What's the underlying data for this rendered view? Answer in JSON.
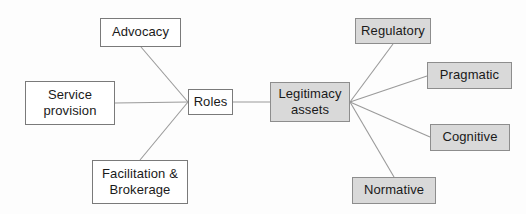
{
  "diagram": {
    "type": "node-link-flow-diagram",
    "canvas": {
      "width": 526,
      "height": 214,
      "background": "#fdfdfd"
    },
    "colors": {
      "plain_fill": "#ffffff",
      "plain_border": "#7a7a7a",
      "filled_fill": "#d9d9d9",
      "filled_border": "#8d8d8d",
      "edge": "#9a9a9a",
      "text": "#1a1a1a"
    },
    "nodes": [
      {
        "id": "advocacy",
        "label": "Advocacy",
        "style": "plain",
        "x": 100,
        "y": 18,
        "w": 81,
        "h": 29
      },
      {
        "id": "service_provision",
        "label": "Service\nprovision",
        "style": "plain",
        "x": 25,
        "y": 81,
        "w": 90,
        "h": 44
      },
      {
        "id": "facilitation_brokerage",
        "label": "Facilitation &\nBrokerage",
        "style": "plain",
        "x": 92,
        "y": 160,
        "w": 96,
        "h": 44
      },
      {
        "id": "roles",
        "label": "Roles",
        "style": "plain",
        "x": 188,
        "y": 89,
        "w": 45,
        "h": 26
      },
      {
        "id": "legitimacy_assets",
        "label": "Legitimacy\nassets",
        "style": "filled",
        "x": 270,
        "y": 82,
        "w": 80,
        "h": 40
      },
      {
        "id": "regulatory",
        "label": "Regulatory",
        "style": "filled",
        "x": 355,
        "y": 18,
        "w": 76,
        "h": 26
      },
      {
        "id": "pragmatic",
        "label": "Pragmatic",
        "style": "filled",
        "x": 427,
        "y": 62,
        "w": 85,
        "h": 27
      },
      {
        "id": "cognitive",
        "label": "Cognitive",
        "style": "filled",
        "x": 430,
        "y": 124,
        "w": 80,
        "h": 27
      },
      {
        "id": "normative",
        "label": "Normative",
        "style": "filled",
        "x": 352,
        "y": 177,
        "w": 84,
        "h": 27
      }
    ],
    "edges": [
      {
        "id": "advocacy-roles",
        "from": "advocacy",
        "to": "roles",
        "x1": 141,
        "y1": 47,
        "x2": 188,
        "y2": 102
      },
      {
        "id": "service-roles",
        "from": "service_provision",
        "to": "roles",
        "x1": 115,
        "y1": 103,
        "x2": 188,
        "y2": 102
      },
      {
        "id": "facilitation-roles",
        "from": "facilitation_brokerage",
        "to": "roles",
        "x1": 140,
        "y1": 160,
        "x2": 188,
        "y2": 102
      },
      {
        "id": "roles-legitimacy",
        "from": "roles",
        "to": "legitimacy_assets",
        "x1": 233,
        "y1": 102,
        "x2": 270,
        "y2": 102
      },
      {
        "id": "legitimacy-regulatory",
        "from": "legitimacy_assets",
        "to": "regulatory",
        "x1": 350,
        "y1": 102,
        "x2": 393,
        "y2": 44
      },
      {
        "id": "legitimacy-pragmatic",
        "from": "legitimacy_assets",
        "to": "pragmatic",
        "x1": 350,
        "y1": 102,
        "x2": 427,
        "y2": 76
      },
      {
        "id": "legitimacy-cognitive",
        "from": "legitimacy_assets",
        "to": "cognitive",
        "x1": 350,
        "y1": 102,
        "x2": 430,
        "y2": 137
      },
      {
        "id": "legitimacy-normative",
        "from": "legitimacy_assets",
        "to": "normative",
        "x1": 350,
        "y1": 102,
        "x2": 394,
        "y2": 177
      }
    ]
  }
}
